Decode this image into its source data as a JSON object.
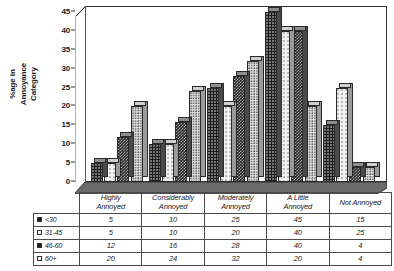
{
  "chart_data": {
    "type": "bar",
    "title": "",
    "xlabel": "",
    "ylabel": "%age in\nAnnoyance\nCategory",
    "ylim": [
      0,
      45
    ],
    "ytick_step": 5,
    "yticks": [
      "0",
      "5",
      "10",
      "15",
      "20",
      "25",
      "30",
      "35",
      "40",
      "45"
    ],
    "grid": false,
    "legend_position": "table-below",
    "three_d": true,
    "categories": [
      "Highly Annoyed",
      "Considerably Annoyed",
      "Moderately Annoyed",
      "A Little Annoyed",
      "Not Annoyed"
    ],
    "category_lines": [
      [
        "Highly",
        "Annoyed"
      ],
      [
        "Considerably",
        "Annoyed"
      ],
      [
        "Moderately",
        "Annoyed"
      ],
      [
        "A Little",
        "Annoyed"
      ],
      [
        "Not Annoyed",
        ""
      ]
    ],
    "series": [
      {
        "name": "<30",
        "values": [
          5,
          10,
          25,
          45,
          15
        ],
        "pattern": "dark-dotted",
        "swatch": "dark"
      },
      {
        "name": "31-45",
        "values": [
          5,
          10,
          20,
          40,
          25
        ],
        "pattern": "light-dotted",
        "swatch": "light"
      },
      {
        "name": "46-60",
        "values": [
          12,
          16,
          28,
          40,
          4
        ],
        "pattern": "dark-checker",
        "swatch": "dark"
      },
      {
        "name": "60+",
        "values": [
          20,
          24,
          32,
          20,
          4
        ],
        "pattern": "pale-dotted",
        "swatch": "light"
      }
    ]
  },
  "colors": {
    "axis": "#333333",
    "frame": "#333333",
    "floor": "#5a5a5a",
    "series_dark": "#1d1d1d",
    "series_light": "#f2f2f2",
    "text": "#1a1a1a"
  }
}
